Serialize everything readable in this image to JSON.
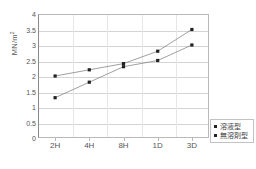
{
  "chart_data": {
    "type": "line",
    "title": "",
    "xlabel": "",
    "ylabel": "MN/m2",
    "ylabel_base": "MN/m",
    "ylabel_sup": "2",
    "categories": [
      "2H",
      "4H",
      "8H",
      "1D",
      "3D"
    ],
    "ylim": [
      0,
      4
    ],
    "yticks": [
      0,
      0.5,
      1,
      1.5,
      2,
      2.5,
      3,
      3.5,
      4
    ],
    "ytick_labels": [
      "0",
      "0.5",
      "1",
      "1.5",
      "2",
      "2.5",
      "3",
      "3.5",
      "4"
    ],
    "grid": true,
    "legend_position": "right-bottom",
    "series": [
      {
        "name": "溶液型",
        "values": [
          2.0,
          2.2,
          2.4,
          2.8,
          3.5
        ],
        "color": "#222222",
        "marker": "square"
      },
      {
        "name": "無溶剤型",
        "values": [
          1.3,
          1.8,
          2.3,
          2.5,
          3.0
        ],
        "color": "#222222",
        "marker": "square"
      }
    ]
  },
  "legend": {
    "items": [
      {
        "label": "溶液型"
      },
      {
        "label": "無溶剤型"
      }
    ]
  },
  "colors": {
    "axis": "#8a8a8a",
    "grid": "#d4d4d4",
    "text": "#555555",
    "line": "#777777",
    "marker": "#222222"
  }
}
